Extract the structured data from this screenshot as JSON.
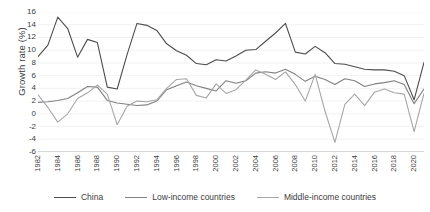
{
  "chart_data": {
    "type": "line",
    "title": "",
    "xlabel": "",
    "ylabel": "Growth rate (%)",
    "ylim": [
      -6,
      16
    ],
    "yticks": [
      -6,
      -4,
      -2,
      0,
      2,
      4,
      6,
      8,
      10,
      12,
      14,
      16
    ],
    "grid": true,
    "legend_position": "bottom",
    "x": [
      1982,
      1983,
      1984,
      1985,
      1986,
      1987,
      1988,
      1989,
      1990,
      1991,
      1992,
      1993,
      1994,
      1995,
      1996,
      1997,
      1998,
      1999,
      2000,
      2001,
      2002,
      2003,
      2004,
      2005,
      2006,
      2007,
      2008,
      2009,
      2010,
      2011,
      2012,
      2013,
      2014,
      2015,
      2016,
      2017,
      2018,
      2019,
      2020,
      2021
    ],
    "xtick_labels": [
      "1982",
      "1984",
      "1986",
      "1988",
      "1990",
      "1992",
      "1994",
      "1996",
      "1998",
      "2000",
      "2002",
      "2004",
      "2006",
      "2008",
      "2010",
      "2012",
      "2014",
      "2016",
      "2018",
      "2020"
    ],
    "series": [
      {
        "name": "China",
        "color": "#4d4d4d",
        "values": [
          9.0,
          10.8,
          15.2,
          13.4,
          8.9,
          11.7,
          11.2,
          4.2,
          3.9,
          9.3,
          14.2,
          13.9,
          13.1,
          11.0,
          9.9,
          9.2,
          7.9,
          7.7,
          8.5,
          8.3,
          9.1,
          10.0,
          10.1,
          11.4,
          12.7,
          14.2,
          9.7,
          9.4,
          10.6,
          9.6,
          7.9,
          7.8,
          7.4,
          7.0,
          6.9,
          6.9,
          6.7,
          6.0,
          2.2,
          8.1
        ]
      },
      {
        "name": "Low-income countries",
        "color": "#808080",
        "values": [
          1.8,
          1.9,
          2.1,
          2.4,
          3.3,
          4.3,
          4.2,
          2.1,
          1.7,
          1.5,
          1.3,
          1.4,
          2.0,
          3.8,
          4.4,
          5.0,
          4.4,
          4.0,
          3.6,
          5.2,
          4.8,
          5.2,
          6.4,
          6.6,
          6.4,
          7.0,
          6.2,
          5.1,
          5.9,
          5.4,
          4.6,
          5.5,
          5.2,
          4.3,
          4.7,
          4.9,
          5.2,
          4.6,
          1.6,
          3.9
        ]
      },
      {
        "name": "Middle-income countries",
        "color": "#a6a6a6",
        "values": [
          3.0,
          1.0,
          -1.3,
          0.0,
          2.4,
          3.3,
          4.5,
          3.1,
          -1.7,
          1.2,
          2.0,
          1.9,
          2.2,
          4.0,
          5.4,
          5.5,
          2.9,
          2.5,
          4.7,
          3.2,
          3.8,
          5.3,
          6.9,
          6.2,
          5.4,
          6.6,
          4.6,
          2.0,
          6.2,
          0.4,
          -4.5,
          1.5,
          3.1,
          1.3,
          3.4,
          3.9,
          3.3,
          3.1,
          -2.8,
          3.2
        ]
      }
    ]
  },
  "legend": {
    "items": [
      {
        "label": "China"
      },
      {
        "label": "Low-income countries"
      },
      {
        "label": "Middle-income countries"
      }
    ]
  }
}
